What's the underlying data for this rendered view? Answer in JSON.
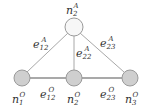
{
  "diagram": {
    "type": "graph",
    "colors": {
      "edge": "#a8a8a8",
      "edge_bottom": "#8c8c8c",
      "top_node_fill": "#f7f7f7",
      "bottom_node_fill": "#cfcfcf",
      "node_stroke": "#9a9a9a",
      "label": "#333333"
    },
    "nodes": [
      {
        "id": "n2A",
        "base": "n",
        "sub": "2",
        "sup": "A",
        "x": 74,
        "y": 27,
        "r": 9,
        "layer": "A"
      },
      {
        "id": "n1O",
        "base": "n",
        "sub": "1",
        "sup": "O",
        "x": 22,
        "y": 78,
        "r": 8,
        "layer": "O"
      },
      {
        "id": "n2O",
        "base": "n",
        "sub": "2",
        "sup": "O",
        "x": 74,
        "y": 78,
        "r": 8,
        "layer": "O"
      },
      {
        "id": "n3O",
        "base": "n",
        "sub": "3",
        "sup": "O",
        "x": 130,
        "y": 78,
        "r": 8,
        "layer": "O"
      }
    ],
    "edges": [
      {
        "id": "e12A",
        "from": "n2A",
        "to": "n1O",
        "base": "e",
        "sub": "12",
        "sup": "A"
      },
      {
        "id": "e22A",
        "from": "n2A",
        "to": "n2O",
        "base": "e",
        "sub": "22",
        "sup": "A"
      },
      {
        "id": "e23A",
        "from": "n2A",
        "to": "n3O",
        "base": "e",
        "sub": "23",
        "sup": "A"
      },
      {
        "id": "e12O",
        "from": "n1O",
        "to": "n2O",
        "base": "e",
        "sub": "12",
        "sup": "O"
      },
      {
        "id": "e23O",
        "from": "n2O",
        "to": "n3O",
        "base": "e",
        "sub": "23",
        "sup": "O"
      }
    ],
    "labels": {
      "n2A": {
        "base": "n",
        "sub": "2",
        "sup": "A"
      },
      "n1O": {
        "base": "n",
        "sub": "1",
        "sup": "O"
      },
      "n2O": {
        "base": "n",
        "sub": "2",
        "sup": "O"
      },
      "n3O": {
        "base": "n",
        "sub": "3",
        "sup": "O"
      },
      "e12A": {
        "base": "e",
        "sub": "12",
        "sup": "A"
      },
      "e22A": {
        "base": "e",
        "sub": "22",
        "sup": "A"
      },
      "e23A": {
        "base": "e",
        "sub": "23",
        "sup": "A"
      },
      "e12O": {
        "base": "e",
        "sub": "12",
        "sup": "O"
      },
      "e23O": {
        "base": "e",
        "sub": "23",
        "sup": "O"
      }
    }
  }
}
